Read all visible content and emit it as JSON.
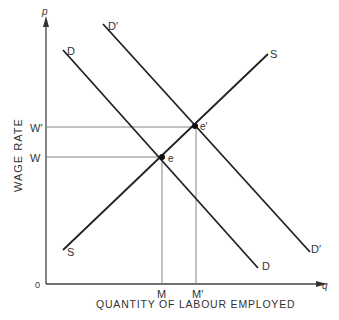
{
  "diagram": {
    "type": "supply-demand",
    "y_axis_label": "WAGE RATE",
    "y_axis_symbol": "p",
    "x_axis_label": "QUANTITY OF LABOUR EMPLOYED",
    "x_axis_symbol": "q",
    "origin_label": "0",
    "wage_labels": {
      "w": "W",
      "w_prime": "W′"
    },
    "quantity_labels": {
      "m": "M",
      "m_prime": "M′"
    },
    "curves": {
      "demand": {
        "label_top": "D",
        "label_bottom": "D"
      },
      "demand_shifted": {
        "label_top": "D′",
        "label_bottom": "D′"
      },
      "supply": {
        "label_top": "S",
        "label_bottom": "S"
      }
    },
    "points": {
      "e": "e",
      "e_prime": "e′"
    }
  }
}
